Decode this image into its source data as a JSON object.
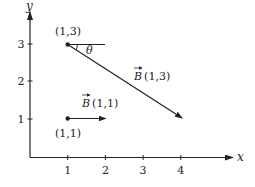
{
  "diagram": {
    "axes": {
      "x_label": "x",
      "y_label": "y",
      "x_ticks": [
        "1",
        "2",
        "3",
        "4"
      ],
      "y_ticks": [
        "1",
        "2",
        "3"
      ]
    },
    "points": [
      {
        "label": "(1,3)",
        "x": 1,
        "y": 3
      },
      {
        "label": "(1,1)",
        "x": 1,
        "y": 1
      }
    ],
    "vectors": [
      {
        "name": "B",
        "arg": "(1,3)",
        "from": [
          1,
          3
        ],
        "to": [
          4,
          1
        ]
      },
      {
        "name": "B",
        "arg": "(1,1)",
        "from": [
          1,
          1
        ],
        "to": [
          2,
          1
        ]
      }
    ],
    "angle_label": "θ",
    "colors": {
      "ink": "#222222",
      "background": "#ffffff"
    }
  }
}
